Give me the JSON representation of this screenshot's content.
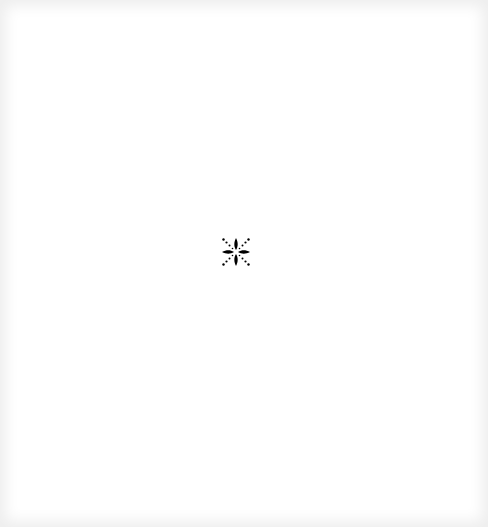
{
  "page": {
    "state": "loading",
    "background": "#ffffff",
    "vignette_color": "#eeeeee"
  },
  "loader": {
    "icon": "loading-spinner-icon",
    "color": "#000000",
    "label": "Loading"
  }
}
